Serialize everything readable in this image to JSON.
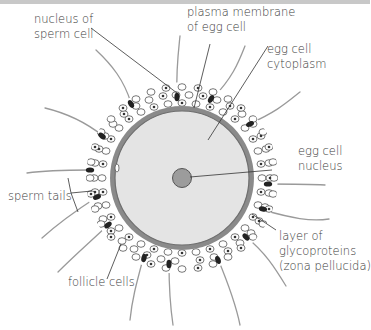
{
  "diagram": {
    "type": "labeled-biology-illustration",
    "colors": {
      "cytoplasm": "#e4e4e4",
      "zona_ring": "#8a8a8a",
      "membrane_inner": "#6f6f6f",
      "nucleus": "#9c9c9c",
      "sperm_head": "#222222",
      "sperm_tail": "#9a9a9a",
      "follicle_cell_fill": "#ffffff",
      "follicle_cell_stroke": "#555555",
      "label_text": "#3a3a3a",
      "leader_line": "#333333",
      "top_bar": "#c8c8c8"
    },
    "labels": {
      "nucleus_of_sperm": [
        "nucleus of",
        "sperm cell"
      ],
      "plasma_membrane": [
        "plasma membrane",
        "of egg cell"
      ],
      "egg_cytoplasm": [
        "egg cell",
        "cytoplasm"
      ],
      "egg_nucleus": [
        "egg cell",
        "nucleus"
      ],
      "sperm_tails": [
        "sperm tails"
      ],
      "zona_pellucida": [
        "layer of",
        "glycoproteins",
        "(zona pellucida)"
      ],
      "follicle_cells": [
        "follicle cells"
      ]
    }
  }
}
